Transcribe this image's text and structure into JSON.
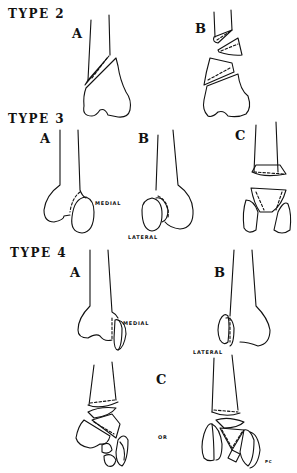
{
  "figure": {
    "sections": [
      {
        "title": "TYPE 2",
        "panels": [
          "A",
          "B"
        ]
      },
      {
        "title": "TYPE 3",
        "panels": [
          "A",
          "B",
          "C"
        ]
      },
      {
        "title": "TYPE 4",
        "panels": [
          "A",
          "B",
          "C"
        ]
      }
    ],
    "annotations": {
      "t3_medial": "MEDIAL",
      "t3_lateral": "LATERAL",
      "t4_medial": "MEDIAL",
      "t4_lateral": "LATERAL",
      "t4_or": "OR",
      "signature": "PC"
    }
  }
}
